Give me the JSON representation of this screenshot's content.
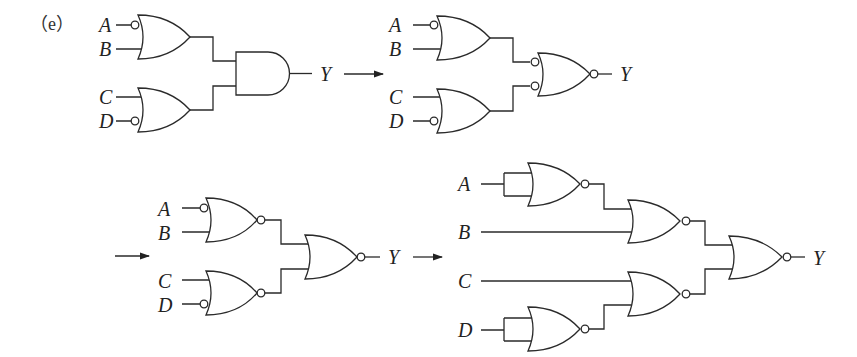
{
  "figure": {
    "tag": "（e）"
  },
  "diagrams": [
    {
      "id": "step1",
      "type": "OR-AND",
      "inputs": [
        "A",
        "B",
        "C",
        "D"
      ],
      "inverted_inputs": [
        "A",
        "D"
      ],
      "gates": [
        "OR(A', B)",
        "OR(C, D')",
        "AND"
      ],
      "output": "Y"
    },
    {
      "id": "step2",
      "type": "OR-NOR with inverted inputs",
      "inputs": [
        "A",
        "B",
        "C",
        "D"
      ],
      "inverted_inputs": [
        "A",
        "D"
      ],
      "gates": [
        "OR(A', B)",
        "OR(C, D')",
        "NOR with inverted inputs"
      ],
      "output": "Y"
    },
    {
      "id": "step3",
      "type": "NOR-NOR",
      "inputs": [
        "A",
        "B",
        "C",
        "D"
      ],
      "inverted_inputs": [
        "A",
        "D"
      ],
      "gates": [
        "NOR(A', B)",
        "NOR(C, D')",
        "NOR"
      ],
      "output": "Y"
    },
    {
      "id": "step4",
      "type": "All NOR",
      "inputs": [
        "A",
        "B",
        "C",
        "D"
      ],
      "gates": [
        "NOR(A, A)",
        "NOR(A', B)",
        "NOR(D, D)",
        "NOR(C, D')",
        "NOR"
      ],
      "output": "Y"
    }
  ],
  "labels": {
    "A": "A",
    "B": "B",
    "C": "C",
    "D": "D",
    "Y": "Y"
  }
}
